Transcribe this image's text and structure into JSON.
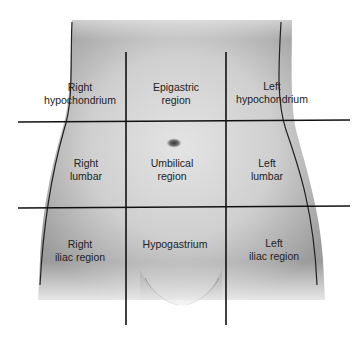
{
  "diagram": {
    "regions": [
      {
        "id": "right-hypochondrium",
        "lines": [
          "Right",
          "hypochondrium"
        ]
      },
      {
        "id": "epigastric",
        "lines": [
          "Epigastric",
          "region"
        ]
      },
      {
        "id": "left-hypochondrium",
        "lines": [
          "Left",
          "hypochondrium"
        ]
      },
      {
        "id": "right-lumbar",
        "lines": [
          "Right",
          "lumbar"
        ]
      },
      {
        "id": "umbilical",
        "lines": [
          "Umbilical",
          "region"
        ]
      },
      {
        "id": "left-lumbar",
        "lines": [
          "Left",
          "lumbar"
        ]
      },
      {
        "id": "right-iliac",
        "lines": [
          "Right",
          "iliac region"
        ]
      },
      {
        "id": "hypogastrium",
        "lines": [
          "Hypogastrium"
        ]
      },
      {
        "id": "left-iliac",
        "lines": [
          "Left",
          "iliac region"
        ]
      }
    ],
    "colors": {
      "grid_line": "#111111",
      "body_outline": "#222222",
      "skin_light": "#e6e6e6",
      "skin_dark": "#9a9a9a",
      "label_text": "#222222"
    }
  }
}
